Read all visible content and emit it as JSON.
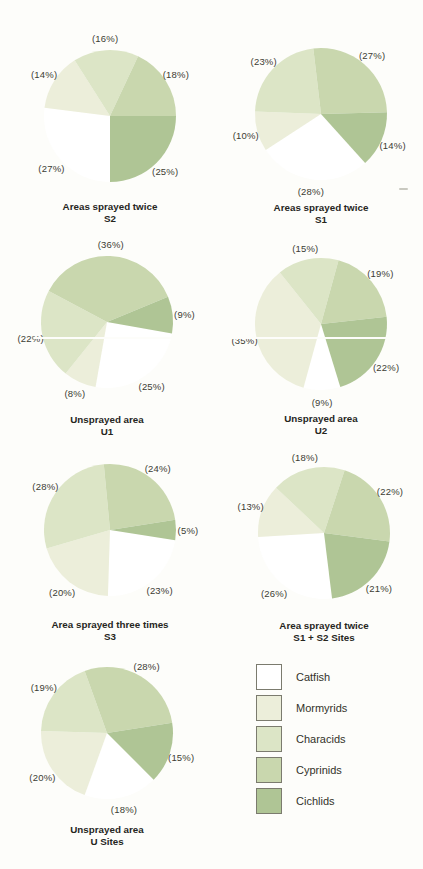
{
  "palette": {
    "Catfish": "#ffffff",
    "Mormyrids": "#eceeda",
    "Characids": "#dce5c6",
    "Cyprinids": "#c9d7ae",
    "Cichlids": "#afc595"
  },
  "legend": {
    "items": [
      {
        "label": "Catfish",
        "color": "#ffffff"
      },
      {
        "label": "Mormyrids",
        "color": "#eceeda"
      },
      {
        "label": "Characids",
        "color": "#dce5c6"
      },
      {
        "label": "Cyprinids",
        "color": "#c9d7ae"
      },
      {
        "label": "Cichlids",
        "color": "#afc595"
      }
    ]
  },
  "chart_data": [
    {
      "type": "pie",
      "title": "Areas sprayed twice",
      "subtitle": "S2",
      "start_angle_deg": 180,
      "slices": [
        {
          "species": "Catfish",
          "pct": 27,
          "text": "(27%)"
        },
        {
          "species": "Mormyrids",
          "pct": 14,
          "text": "(14%)"
        },
        {
          "species": "Characids",
          "pct": 16,
          "text": "(16%)"
        },
        {
          "species": "Cyprinids",
          "pct": 18,
          "text": "(18%)"
        },
        {
          "species": "Cichlids",
          "pct": 25,
          "text": "(25%)"
        }
      ]
    },
    {
      "type": "pie",
      "title": "Areas sprayed twice",
      "subtitle": "S1",
      "start_angle_deg": 138,
      "slices": [
        {
          "species": "Catfish",
          "pct": 28,
          "text": "(28%)"
        },
        {
          "species": "Mormyrids",
          "pct": 10,
          "text": "(10%)"
        },
        {
          "species": "Characids",
          "pct": 23,
          "text": "(23%)"
        },
        {
          "species": "Cyprinids",
          "pct": 27,
          "text": "(27%)"
        },
        {
          "species": "Cichlids",
          "pct": 14,
          "text": "(14%)"
        }
      ]
    },
    {
      "type": "pie",
      "title": "Unsprayed area",
      "subtitle": "U1",
      "start_angle_deg": 100,
      "slices": [
        {
          "species": "Catfish",
          "pct": 25,
          "text": "(25%)"
        },
        {
          "species": "Mormyrids",
          "pct": 8,
          "text": "(8%)"
        },
        {
          "species": "Characids",
          "pct": 22,
          "text": "(22%)"
        },
        {
          "species": "Cyprinids",
          "pct": 36,
          "text": "(36%)"
        },
        {
          "species": "Cichlids",
          "pct": 9,
          "text": "(9%)"
        }
      ]
    },
    {
      "type": "pie",
      "title": "Unsprayed area",
      "subtitle": "U2",
      "start_angle_deg": 163,
      "slices": [
        {
          "species": "Catfish",
          "pct": 9,
          "text": "(9%)"
        },
        {
          "species": "Mormyrids",
          "pct": 35,
          "text": "(35%)"
        },
        {
          "species": "Characids",
          "pct": 15,
          "text": "(15%)"
        },
        {
          "species": "Cyprinids",
          "pct": 19,
          "text": "(19%)"
        },
        {
          "species": "Cichlids",
          "pct": 22,
          "text": "(22%)"
        }
      ]
    },
    {
      "type": "pie",
      "title": "Area sprayed three times",
      "subtitle": "S3",
      "start_angle_deg": 99,
      "slices": [
        {
          "species": "Catfish",
          "pct": 23,
          "text": "(23%)"
        },
        {
          "species": "Mormyrids",
          "pct": 20,
          "text": "(20%)"
        },
        {
          "species": "Characids",
          "pct": 28,
          "text": "(28%)"
        },
        {
          "species": "Cyprinids",
          "pct": 24,
          "text": "(24%)"
        },
        {
          "species": "Cichlids",
          "pct": 5,
          "text": "(5%)"
        }
      ]
    },
    {
      "type": "pie",
      "title": "Area sprayed twice",
      "subtitle": "S1 + S2 Sites",
      "start_angle_deg": 173,
      "slices": [
        {
          "species": "Catfish",
          "pct": 26,
          "text": "(26%)"
        },
        {
          "species": "Mormyrids",
          "pct": 13,
          "text": "(13%)"
        },
        {
          "species": "Characids",
          "pct": 18,
          "text": "(18%)"
        },
        {
          "species": "Cyprinids",
          "pct": 22,
          "text": "(22%)"
        },
        {
          "species": "Cichlids",
          "pct": 21,
          "text": "(21%)"
        }
      ]
    },
    {
      "type": "pie",
      "title": "Unsprayed area",
      "subtitle": "U Sites",
      "start_angle_deg": 135,
      "slices": [
        {
          "species": "Catfish",
          "pct": 18,
          "text": "(18%)"
        },
        {
          "species": "Mormyrids",
          "pct": 20,
          "text": "(20%)"
        },
        {
          "species": "Characids",
          "pct": 19,
          "text": "(19%)"
        },
        {
          "species": "Cyprinids",
          "pct": 28,
          "text": "(28%)"
        },
        {
          "species": "Cichlids",
          "pct": 15,
          "text": "(15%)"
        }
      ]
    }
  ]
}
